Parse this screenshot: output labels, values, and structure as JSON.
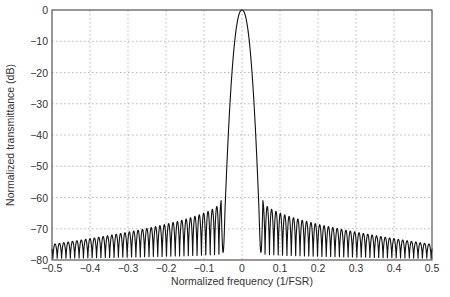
{
  "chart_data": {
    "type": "line",
    "title": "",
    "xlabel": "Normalized frequency (1/FSR)",
    "ylabel": "Normalized transmittance (dB)",
    "xlim": [
      -0.5,
      0.5
    ],
    "ylim": [
      -80,
      0
    ],
    "xticks": [
      -0.5,
      -0.4,
      -0.3,
      -0.2,
      -0.1,
      0,
      0.1,
      0.2,
      0.3,
      0.4,
      0.5
    ],
    "xtick_labels": [
      "−0.5",
      "−0.4",
      "−0.3",
      "−0.2",
      "−0.1",
      "0",
      "0.1",
      "0.2",
      "0.3",
      "0.4",
      "0.5"
    ],
    "yticks": [
      0,
      -10,
      -20,
      -30,
      -40,
      -50,
      -60,
      -70,
      -80
    ],
    "ytick_labels": [
      "0",
      "−10",
      "−20",
      "−30",
      "−40",
      "−50",
      "−60",
      "−70",
      "−80"
    ],
    "grid": true,
    "legend": null,
    "series": [
      {
        "name": "transmittance",
        "color": "#111111",
        "main_lobe": {
          "center": 0,
          "peak_db": 0,
          "half_width_at_-65dB": 0.045
        },
        "sidelobes": {
          "first_peak_x": 0.055,
          "first_peak_db": -61,
          "edge_peak_db": -75,
          "period": 0.0115,
          "null_db": -80
        },
        "sample_points": [
          {
            "x": -0.5,
            "y": -75
          },
          {
            "x": -0.4,
            "y": -74
          },
          {
            "x": -0.3,
            "y": -72
          },
          {
            "x": -0.2,
            "y": -70
          },
          {
            "x": -0.1,
            "y": -66
          },
          {
            "x": -0.055,
            "y": -61
          },
          {
            "x": -0.045,
            "y": -65
          },
          {
            "x": -0.03,
            "y": -30
          },
          {
            "x": -0.015,
            "y": -8
          },
          {
            "x": 0,
            "y": 0
          },
          {
            "x": 0.015,
            "y": -8
          },
          {
            "x": 0.03,
            "y": -30
          },
          {
            "x": 0.045,
            "y": -65
          },
          {
            "x": 0.055,
            "y": -61
          },
          {
            "x": 0.1,
            "y": -66
          },
          {
            "x": 0.2,
            "y": -70
          },
          {
            "x": 0.3,
            "y": -72
          },
          {
            "x": 0.4,
            "y": -74
          },
          {
            "x": 0.5,
            "y": -75
          }
        ]
      }
    ]
  },
  "layout": {
    "plot_left": 52,
    "plot_right": 432,
    "plot_top": 10,
    "plot_bottom": 260
  }
}
